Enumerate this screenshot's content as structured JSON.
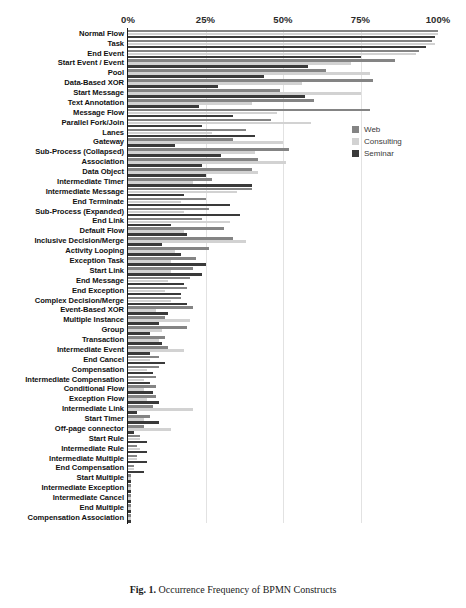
{
  "figure": {
    "caption_label": "Fig. 1.",
    "caption_text": "Occurrence Frequency of BPMN Constructs"
  },
  "legend": {
    "position": "inside-right-upper",
    "items": [
      {
        "label": "Web",
        "color": "#848484"
      },
      {
        "label": "Consulting",
        "color": "#d2d2d2"
      },
      {
        "label": "Seminar",
        "color": "#3a3a3a"
      }
    ]
  },
  "chart_data": {
    "type": "bar",
    "orientation": "horizontal",
    "title": "",
    "xlabel": "",
    "ylabel": "",
    "xlim": [
      0,
      100
    ],
    "grid": true,
    "tick_labels": [
      "0%",
      "25%",
      "50%",
      "75%",
      "100%"
    ],
    "ticks": [
      0,
      25,
      50,
      75,
      100
    ],
    "categories": [
      "Normal Flow",
      "Task",
      "End Event",
      "Start Event / Event",
      "Pool",
      "Data-Based XOR",
      "Start Message",
      "Text Annotation",
      "Message Flow",
      "Parallel Fork/Join",
      "Lanes",
      "Gateway",
      "Sub-Process (Collapsed)",
      "Association",
      "Data Object",
      "Intermediate Timer",
      "Intermediate Message",
      "End Terminate",
      "Sub-Process (Expanded)",
      "End Link",
      "Default Flow",
      "Inclusive Decision/Merge",
      "Activity Looping",
      "Exception Task",
      "Start Link",
      "End Message",
      "End Exception",
      "Complex Decision/Merge",
      "Event-Based XOR",
      "Multiple Instance",
      "Group",
      "Transaction",
      "Intermediate Event",
      "End Cancel",
      "Compensation",
      "Intermediate Compensation",
      "Conditional Flow",
      "Exception Flow",
      "Intermediate Link",
      "Start Timer",
      "Off-page connector",
      "Start Rule",
      "Intermediate Rule",
      "Intermediate Multiple",
      "End Compensation",
      "Start Multiple",
      "Intermediate Exception",
      "Intermediate Cancel",
      "End Multiple",
      "Compensation Association"
    ],
    "series": [
      {
        "name": "Web",
        "color": "#848484",
        "values": [
          100,
          98,
          94,
          86,
          64,
          79,
          49,
          60,
          78,
          46,
          38,
          34,
          52,
          42,
          40,
          27,
          40,
          25,
          26,
          24,
          31,
          34,
          26,
          22,
          21,
          20,
          19,
          17,
          21,
          12,
          19,
          12,
          13,
          10,
          10,
          9,
          9,
          9,
          8,
          7,
          5,
          4,
          3,
          3,
          2,
          1,
          1,
          1,
          1,
          1
        ]
      },
      {
        "name": "Consulting",
        "color": "#d2d2d2",
        "values": [
          100,
          99,
          93,
          72,
          78,
          56,
          75,
          40,
          48,
          59,
          27,
          50,
          41,
          51,
          42,
          21,
          35,
          17,
          18,
          33,
          18,
          38,
          15,
          14,
          14,
          13,
          12,
          14,
          9,
          20,
          11,
          10,
          18,
          7,
          6,
          5,
          5,
          6,
          21,
          5,
          14,
          4,
          4,
          3,
          2,
          1,
          1,
          1,
          1,
          1
        ]
      },
      {
        "name": "Seminar",
        "color": "#3a3a3a",
        "values": [
          99,
          96,
          75,
          58,
          44,
          29,
          57,
          23,
          34,
          24,
          41,
          15,
          30,
          24,
          25,
          40,
          18,
          33,
          36,
          14,
          19,
          11,
          17,
          25,
          24,
          18,
          17,
          19,
          13,
          10,
          7,
          11,
          7,
          12,
          8,
          7,
          8,
          10,
          3,
          10,
          2,
          6,
          6,
          6,
          5,
          1,
          1,
          1,
          1,
          1
        ]
      }
    ]
  }
}
